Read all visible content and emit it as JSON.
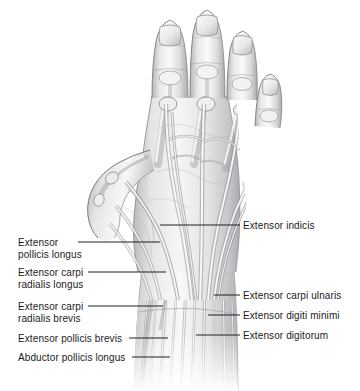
{
  "figure": {
    "style": "grayscale medical illustration",
    "colors": {
      "background": "#ffffff",
      "text": "#1b1b1b",
      "leader_line": "#1f1f1f",
      "skin_light": "#f2f2f3",
      "skin_mid": "#d8d9db",
      "skin_shadow": "#a9abaf",
      "tendon_light": "#fbfbfc",
      "tendon_shadow": "#9b9da1",
      "outline": "#6e7074"
    }
  },
  "labels": {
    "left": [
      {
        "id": "extensor-pollicis-longus",
        "lines": [
          "Extensor",
          "pollicis longus"
        ],
        "text_x": 18,
        "text_y": 237,
        "leader": {
          "x1": 78,
          "y1": 242,
          "x2": 160,
          "y2": 242
        }
      },
      {
        "id": "extensor-carpi-radialis-longus",
        "lines": [
          "Extensor carpi",
          "radialis longus"
        ],
        "text_x": 18,
        "text_y": 267,
        "leader": {
          "x1": 88,
          "y1": 272,
          "x2": 166,
          "y2": 272
        }
      },
      {
        "id": "extensor-carpi-radialis-brevis",
        "lines": [
          "Extensor carpi",
          "radialis brevis"
        ],
        "text_x": 18,
        "text_y": 301,
        "leader": {
          "x1": 88,
          "y1": 306,
          "x2": 163,
          "y2": 306
        }
      },
      {
        "id": "extensor-pollicis-brevis",
        "lines": [
          "Extensor pollicis brevis"
        ],
        "text_x": 18,
        "text_y": 333,
        "leader": {
          "x1": 129,
          "y1": 338,
          "x2": 168,
          "y2": 338
        }
      },
      {
        "id": "abductor-pollicis-longus",
        "lines": [
          "Abductor pollicis longus"
        ],
        "text_x": 18,
        "text_y": 352,
        "leader": {
          "x1": 132,
          "y1": 357,
          "x2": 170,
          "y2": 357
        }
      }
    ],
    "right": [
      {
        "id": "extensor-indicis",
        "lines": [
          "Extensor indicis"
        ],
        "text_x": 243,
        "text_y": 220,
        "leader": {
          "x1": 160,
          "y1": 225,
          "x2": 240,
          "y2": 225
        }
      },
      {
        "id": "extensor-carpi-ulnaris",
        "lines": [
          "Extensor carpi ulnaris"
        ],
        "text_x": 243,
        "text_y": 290,
        "leader": {
          "x1": 214,
          "y1": 295,
          "x2": 240,
          "y2": 295
        }
      },
      {
        "id": "extensor-digiti-minimi",
        "lines": [
          "Extensor digiti minimi"
        ],
        "text_x": 243,
        "text_y": 310,
        "leader": {
          "x1": 208,
          "y1": 315,
          "x2": 240,
          "y2": 315
        }
      },
      {
        "id": "extensor-digitorum",
        "lines": [
          "Extensor digitorum"
        ],
        "text_x": 243,
        "text_y": 330,
        "leader": {
          "x1": 196,
          "y1": 335,
          "x2": 240,
          "y2": 335
        }
      }
    ]
  }
}
